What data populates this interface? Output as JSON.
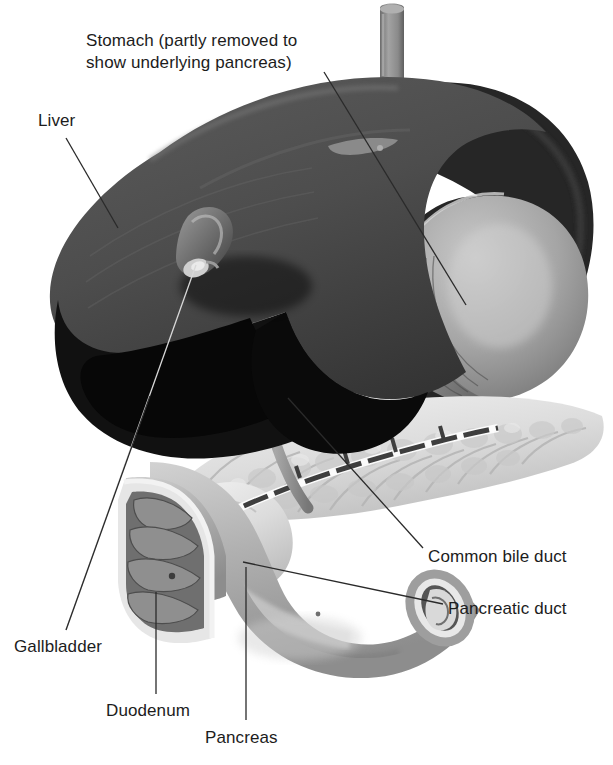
{
  "figure": {
    "kind": "anatomical-illustration",
    "background_color": "#ffffff",
    "text_color": "#1c1c1c",
    "leader_line_color": "#2a2a2a"
  },
  "labels": [
    {
      "id": "stomach",
      "text_line1": "Stomach (partly removed to",
      "text_line2": "show underlying pancreas)",
      "x": 86,
      "y": 30,
      "leader": {
        "x1": 324,
        "y1": 72,
        "x2": 466,
        "y2": 305
      }
    },
    {
      "id": "liver",
      "text_line1": "Liver",
      "text_line2": "",
      "x": 38,
      "y": 110,
      "leader": {
        "x1": 66,
        "y1": 138,
        "x2": 118,
        "y2": 228
      }
    },
    {
      "id": "common-bile-duct",
      "text_line1": "Common bile duct",
      "text_line2": "",
      "x": 428,
      "y": 546,
      "leader": {
        "x1": 423,
        "y1": 548,
        "x2": 288,
        "y2": 398
      }
    },
    {
      "id": "pancreatic-duct",
      "text_line1": "Pancreatic duct",
      "text_line2": "",
      "x": 448,
      "y": 598,
      "leader": {
        "x1": 443,
        "y1": 604,
        "x2": 243,
        "y2": 562
      }
    },
    {
      "id": "gallbladder",
      "text_line1": "Gallbladder",
      "text_line2": "",
      "x": 14,
      "y": 636,
      "leader": {
        "x1": 66,
        "y1": 630,
        "x2": 196,
        "y2": 265
      }
    },
    {
      "id": "duodenum",
      "text_line1": "Duodenum",
      "text_line2": "",
      "x": 106,
      "y": 700,
      "leader": {
        "x1": 156,
        "y1": 694,
        "x2": 156,
        "y2": 592
      }
    },
    {
      "id": "pancreas",
      "text_line1": "Pancreas",
      "text_line2": "",
      "x": 205,
      "y": 727,
      "leader": {
        "x1": 246,
        "y1": 720,
        "x2": 246,
        "y2": 567
      }
    }
  ],
  "organs": {
    "esophagus": {
      "name": "esophagus-stub",
      "fill": "#8e8e8e"
    },
    "liver_top": {
      "name": "liver-superior-surface",
      "fill": "#4a4a4a"
    },
    "liver_shadow": {
      "name": "liver-inferior-shadow",
      "fill": "#0d0d0d"
    },
    "stomach_body": {
      "name": "stomach-body",
      "fill": "#2b2b2b"
    },
    "stomach_cut": {
      "name": "stomach-cut-face",
      "fill": "#9a9a9a"
    },
    "pancreas": {
      "name": "pancreas-gland",
      "fill": "#d8d8d8"
    },
    "duodenum": {
      "name": "duodenum-loop",
      "fill": "#b4b4b4"
    },
    "gallbladder": {
      "name": "gallbladder",
      "fill": "#6e6e6e"
    },
    "bile_duct": {
      "name": "bile-duct",
      "fill": "#8a8a8a"
    },
    "pancreatic_duct": {
      "name": "pancreatic-duct",
      "fill": "#4a4a4a"
    }
  }
}
